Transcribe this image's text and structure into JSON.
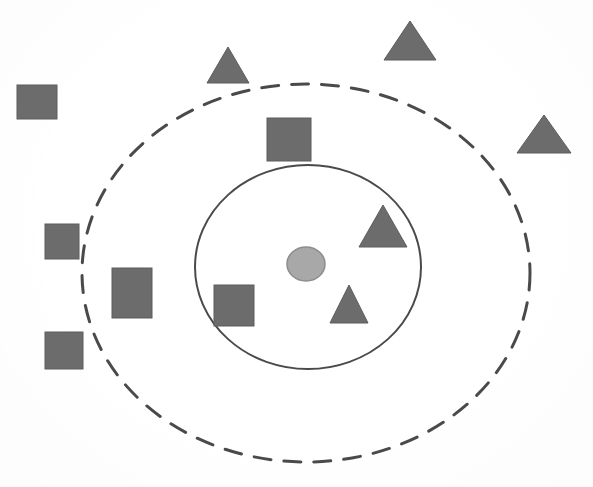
{
  "figure": {
    "canvas": {
      "width": 593,
      "height": 487,
      "background": "#ffffff"
    },
    "colors": {
      "shape_fill": "#6c6c6c",
      "shape_stroke": "#5c5c5c",
      "center_node_fill": "#a8a8a8",
      "center_node_stroke": "#8d8d8d",
      "boundary_stroke": "#4a4a4a",
      "background": "#ffffff"
    },
    "boundaries": [
      {
        "name": "outer-dashed-boundary",
        "shape": "ellipse",
        "style": "dashed",
        "cx": 306,
        "cy": 273,
        "rx": 224,
        "ry": 189,
        "stroke_width": 3,
        "dash_pattern": "17 13"
      },
      {
        "name": "inner-solid-boundary",
        "shape": "ellipse",
        "style": "solid",
        "cx": 308,
        "cy": 267,
        "rx": 113,
        "ry": 102,
        "stroke_width": 2,
        "dash_pattern": "none"
      }
    ],
    "center_node": {
      "name": "center-node",
      "shape": "circle",
      "cx": 306,
      "cy": 264,
      "rx": 19,
      "ry": 17
    },
    "squares": [
      {
        "id": "square-outer-topleft",
        "x": 17,
        "y": 85,
        "w": 40,
        "h": 34,
        "zone": "outside-dashed"
      },
      {
        "id": "square-outer-left-upper",
        "x": 45,
        "y": 224,
        "w": 34,
        "h": 35,
        "zone": "outside-dashed"
      },
      {
        "id": "square-between-left",
        "x": 112,
        "y": 268,
        "w": 40,
        "h": 50,
        "zone": "between-boundaries"
      },
      {
        "id": "square-outer-left-lower",
        "x": 45,
        "y": 332,
        "w": 38,
        "h": 37,
        "zone": "outside-dashed"
      },
      {
        "id": "square-between-top",
        "x": 267,
        "y": 118,
        "w": 44,
        "h": 43,
        "zone": "between-boundaries"
      },
      {
        "id": "square-inner-left",
        "x": 214,
        "y": 285,
        "w": 40,
        "h": 41,
        "zone": "inside-inner"
      }
    ],
    "triangles": [
      {
        "id": "triangle-outer-top-left",
        "cx": 228,
        "base_y": 83,
        "half_w": 21,
        "height": 36,
        "zone": "outside-dashed"
      },
      {
        "id": "triangle-outer-top-right",
        "cx": 410,
        "base_y": 60,
        "half_w": 26,
        "height": 39,
        "zone": "outside-dashed"
      },
      {
        "id": "triangle-outer-right",
        "cx": 544,
        "base_y": 153,
        "half_w": 27,
        "height": 38,
        "zone": "outside-dashed"
      },
      {
        "id": "triangle-inner-upper",
        "cx": 383,
        "base_y": 247,
        "half_w": 24,
        "height": 42,
        "zone": "inside-inner"
      },
      {
        "id": "triangle-inner-lower",
        "cx": 349,
        "base_y": 323,
        "half_w": 19,
        "height": 38,
        "zone": "inside-inner"
      }
    ]
  },
  "chart_data": {
    "type": "scatter",
    "xlabel": "",
    "ylabel": "",
    "xlim": [
      0,
      593
    ],
    "ylim": [
      487,
      0
    ],
    "grid": false,
    "legend": "none",
    "annotations": [
      "Outer dashed ellipse boundary centered at (306, 273) with radii 224 x 189",
      "Inner solid ellipse boundary centered at (308, 267) with radii 113 x 102",
      "Light gray circular node at the center (306, 264)"
    ],
    "series": [
      {
        "name": "squares",
        "marker": "square",
        "color": "#6c6c6c",
        "count": 6,
        "points": [
          {
            "x": 37,
            "y": 102,
            "zone": "outside-dashed"
          },
          {
            "x": 62,
            "y": 241,
            "zone": "outside-dashed"
          },
          {
            "x": 132,
            "y": 293,
            "zone": "between-boundaries"
          },
          {
            "x": 64,
            "y": 350,
            "zone": "outside-dashed"
          },
          {
            "x": 289,
            "y": 139,
            "zone": "between-boundaries"
          },
          {
            "x": 234,
            "y": 305,
            "zone": "inside-inner"
          }
        ]
      },
      {
        "name": "triangles",
        "marker": "triangle",
        "color": "#6c6c6c",
        "count": 5,
        "points": [
          {
            "x": 228,
            "y": 65,
            "zone": "outside-dashed"
          },
          {
            "x": 410,
            "y": 41,
            "zone": "outside-dashed"
          },
          {
            "x": 544,
            "y": 134,
            "zone": "outside-dashed"
          },
          {
            "x": 383,
            "y": 226,
            "zone": "inside-inner"
          },
          {
            "x": 349,
            "y": 304,
            "zone": "inside-inner"
          }
        ]
      },
      {
        "name": "center-node",
        "marker": "circle",
        "color": "#a8a8a8",
        "count": 1,
        "points": [
          {
            "x": 306,
            "y": 264,
            "zone": "inside-inner"
          }
        ]
      }
    ],
    "zone_counts": {
      "inside-inner": {
        "squares": 1,
        "triangles": 2,
        "circles": 1
      },
      "between-boundaries": {
        "squares": 2,
        "triangles": 0,
        "circles": 0
      },
      "outside-dashed": {
        "squares": 3,
        "triangles": 3,
        "circles": 0
      }
    }
  }
}
